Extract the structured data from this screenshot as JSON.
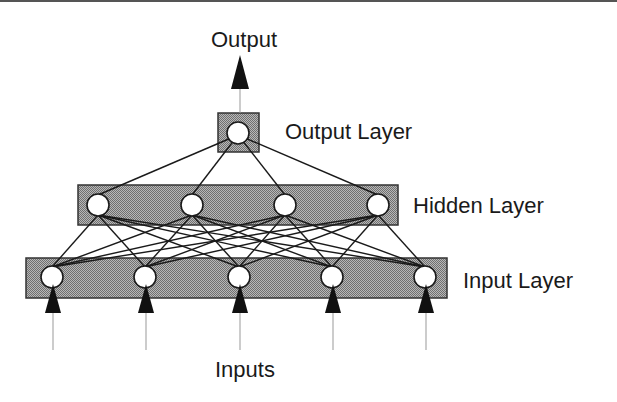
{
  "title": "Output",
  "labels": {
    "output": "Output",
    "output_layer": "Output Layer",
    "hidden_layer": "Hidden Layer",
    "input_layer": "Input Layer",
    "inputs": "Inputs"
  },
  "colors": {
    "layer_fill": "#9a9a9a",
    "layer_stroke": "#333333",
    "node_fill": "#ffffff",
    "node_stroke": "#1a1a1a",
    "edge": "#1a1a1a",
    "arrow": "#111111",
    "stem": "#999999"
  },
  "layers": {
    "output": {
      "box": [
        218,
        113,
        41,
        39
      ],
      "nodes": [
        [
          238,
          133
        ]
      ]
    },
    "hidden": {
      "box": [
        78,
        185,
        320,
        40
      ],
      "nodes": [
        [
          98,
          205
        ],
        [
          192,
          205
        ],
        [
          285,
          205
        ],
        [
          378,
          205
        ]
      ]
    },
    "input": {
      "box": [
        26,
        258,
        421,
        40
      ],
      "nodes": [
        [
          52,
          277
        ],
        [
          145,
          277
        ],
        [
          239,
          277
        ],
        [
          332,
          277
        ],
        [
          425,
          277
        ]
      ]
    }
  },
  "node_radius": 11
}
